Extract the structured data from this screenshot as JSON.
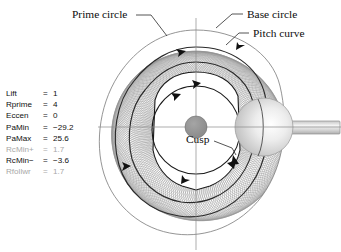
{
  "figure": {
    "title_annotations": {
      "prime_circle": "Prime circle",
      "base_circle": "Base circle",
      "pitch_curve": "Pitch curve",
      "cusp": "Cusp"
    },
    "background_color": "#ffffff",
    "line_color": "#222222",
    "hatch_color": "#808080",
    "dim_text_color": "#a8a8a8",
    "roller_fill": "#d9d9d9",
    "hub_fill": "#909090"
  },
  "parameters": {
    "equals_sign": "=",
    "rows": [
      {
        "name": "Lift",
        "value": "1",
        "dim": false
      },
      {
        "name": "Rprime",
        "value": "4",
        "dim": false
      },
      {
        "name": "Eccen",
        "value": "0",
        "dim": false
      },
      {
        "name": "PaMin",
        "value": "−29.2",
        "dim": false
      },
      {
        "name": "PaMax",
        "value": "25.6",
        "dim": false
      },
      {
        "name": "RcMin+",
        "value": "1.7",
        "dim": true
      },
      {
        "name": "RcMin−",
        "value": "−3.6",
        "dim": false
      },
      {
        "name": "Rfollwr",
        "value": "1.7",
        "dim": true
      }
    ]
  },
  "chart_data": {
    "type": "line",
    "xlabel": "",
    "ylabel": "",
    "grid": false,
    "legend": "none",
    "annotations": [
      "Prime circle",
      "Base circle",
      "Pitch curve",
      "Cusp"
    ],
    "parameters": {
      "Lift": 1,
      "Rprime": 4,
      "Eccen": 0,
      "PaMin": -29.2,
      "PaMax": 25.6,
      "RcMin+": 1.7,
      "RcMin-": -3.6,
      "Rfollwr": 1.7
    },
    "geometry": {
      "cam_center": [
        196,
        127
      ],
      "base_circle_radius": 44,
      "prime_circle_radius": 60,
      "hub_radius": 11,
      "roller_radius": 29,
      "roller_center": [
        264,
        127
      ],
      "follower_shaft": {
        "x": 264,
        "y": 121,
        "width": 74,
        "height": 13
      },
      "envelope_outer_radius_range": [
        74,
        97
      ]
    }
  }
}
